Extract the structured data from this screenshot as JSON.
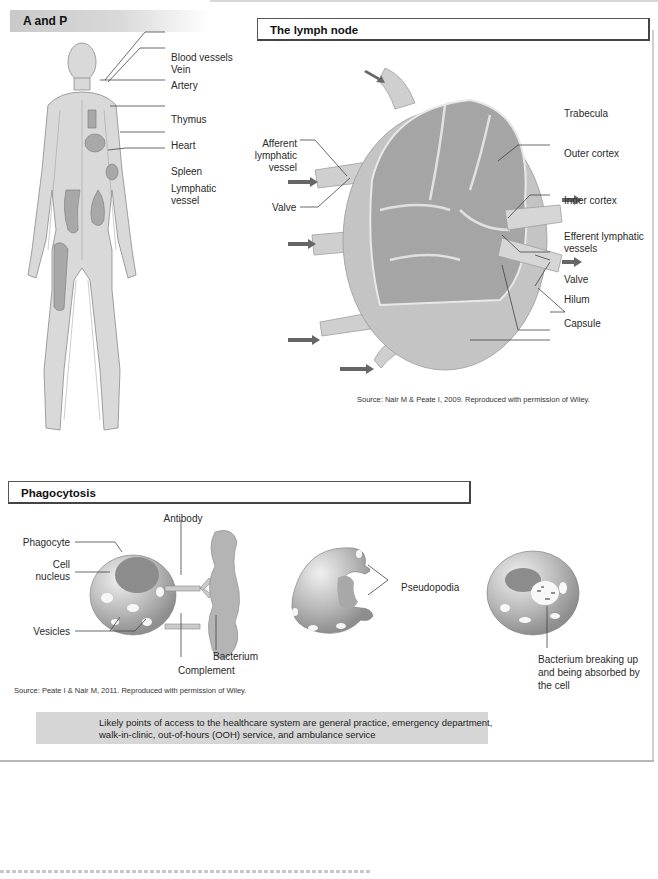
{
  "sections": {
    "anatomy": {
      "header": "A and P",
      "labels": {
        "blood_vessels": "Blood vessels",
        "vein": "Vein",
        "artery": "Artery",
        "thymus": "Thymus",
        "heart": "Heart",
        "spleen": "Spleen",
        "lymphatic_vessel": "Lymphatic vessel"
      }
    },
    "lymph_node": {
      "header": "The lymph node",
      "labels": {
        "afferent": "Afferent lymphatic vessel",
        "valve_left": "Valve",
        "trabecula": "Trabecula",
        "outer_cortex": "Outer cortex",
        "inner_cortex": "Inner cortex",
        "efferent": "Efferent lymphatic vessels",
        "valve_right": "Valve",
        "hilum": "Hilum",
        "capsule": "Capsule"
      },
      "source": "Source: Nair M & Peate I, 2009. Reproduced with permission of Wiley."
    },
    "phagocytosis": {
      "header": "Phagocytosis",
      "labels": {
        "antibody": "Antibody",
        "phagocyte": "Phagocyte",
        "cell_nucleus": "Cell nucleus",
        "vesicles": "Vesicles",
        "bacterium": "Bacterium",
        "complement": "Complement",
        "pseudopodia": "Pseudopodia",
        "bacterium_breaking": "Bacterium breaking up and being absorbed by the cell"
      },
      "source": "Source: Peate I & Nair M, 2011. Reproduced with permission of Wiley."
    }
  },
  "note": "Likely points of access to the healthcare system are general practice, emergency department, walk-in-clinic, out-of-hours (OOH) service, and ambulance service",
  "colors": {
    "header_gray": "#c9c9c9",
    "note_bg": "#d6d6d6",
    "tissue": "#c8c8c8",
    "tissue_dark": "#8f8f8f"
  }
}
